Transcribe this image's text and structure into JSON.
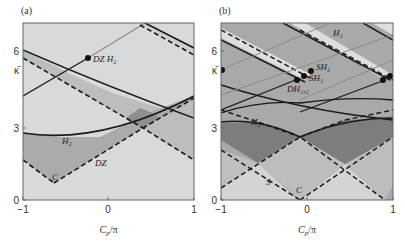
{
  "figure": {
    "panels": [
      {
        "id": "a",
        "title": "(a)",
        "frame": {
          "x0": 23,
          "x1": 194,
          "y0": 23,
          "y1": 200
        },
        "yticks": [
          {
            "label": "6",
            "y": 51
          },
          {
            "label": "κ̄",
            "y": 70
          },
          {
            "label": "3",
            "y": 128
          },
          {
            "label": "0",
            "y": 200
          }
        ],
        "xticks": [
          {
            "label": "−1",
            "x": 23
          },
          {
            "label": "0",
            "x": 108
          },
          {
            "label": "1",
            "x": 194
          }
        ],
        "xlabel": "C_p/π",
        "regions": [
          {
            "name": "background",
            "fill": "#d9d9d9",
            "points": "23,23 194,23 194,200 23,200"
          },
          {
            "name": "band-upper",
            "fill": "#bdbdbd",
            "points": "23,50 23,58 143,128 194,160 194,118 160,108 110,92 70,74"
          },
          {
            "name": "band-H2-lower",
            "fill": "#ababab",
            "points": "23,133 23,160 54,183 143,128 160,118 194,100 194,96 150,112 100,137 60,137"
          },
          {
            "name": "dark-diamond",
            "fill": "#8f8f8f",
            "points": "126,118 143,128 160,118 150,112 140,108"
          },
          {
            "name": "right-lower-band",
            "fill": "#bdbdbd",
            "points": "160,118 194,100 194,160 143,128"
          },
          {
            "name": "top-right-band",
            "fill": "#cfcfcf",
            "points": "145,23 194,48 194,55 140,23"
          }
        ],
        "lines": [
          {
            "name": "upper-solid-curve",
            "style": "solid",
            "color": "#1a1a1a",
            "width": 1.6,
            "path": "M23,50 Q110,88 194,118"
          },
          {
            "name": "upper-dashed",
            "style": "dashed",
            "color": "#1a1a1a",
            "width": 1.6,
            "path": "M23,58 L143,128 L194,160"
          },
          {
            "name": "H2-curve",
            "style": "solid",
            "color": "#1a1a1a",
            "width": 1.6,
            "path": "M23,133 Q100,145 194,96"
          },
          {
            "name": "DZ-dashed-left",
            "style": "dashed",
            "color": "#1a1a1a",
            "width": 1.6,
            "path": "M23,160 L54,183"
          },
          {
            "name": "DZ-dashed-right",
            "style": "dashed",
            "color": "#1a1a1a",
            "width": 1.6,
            "path": "M54,183 L143,128 L194,98"
          },
          {
            "name": "branch-black",
            "style": "solid",
            "color": "#1a1a1a",
            "width": 1.4,
            "path": "M23,96 L88,58"
          },
          {
            "name": "branch-gray",
            "style": "solid",
            "color": "#8a8a8a",
            "width": 1.2,
            "path": "M88,58 L145,23"
          },
          {
            "name": "top-right-solid",
            "style": "solid",
            "color": "#1a1a1a",
            "width": 1.6,
            "path": "M145,23 L194,48"
          },
          {
            "name": "top-right-dashed",
            "style": "dashed",
            "color": "#1a1a1a",
            "width": 1.6,
            "path": "M140,25 L194,55"
          }
        ],
        "points": [
          {
            "name": "DZ-H2-point",
            "x": 88,
            "y": 58,
            "r": 3
          }
        ],
        "annotations": [
          {
            "name": "label-DZ-H2",
            "text": "DZ H₂",
            "x": 93,
            "y": 62
          },
          {
            "name": "label-H2",
            "text": "H₂",
            "x": 62,
            "y": 144
          },
          {
            "name": "label-DZ",
            "text": "DZ",
            "x": 95,
            "y": 166
          },
          {
            "name": "label-C",
            "text": "C",
            "x": 52,
            "y": 180
          }
        ]
      },
      {
        "id": "b",
        "title": "(b)",
        "frame": {
          "x0": 221,
          "x1": 393,
          "y0": 23,
          "y1": 200
        },
        "yticks": [
          {
            "label": "6",
            "y": 51
          },
          {
            "label": "κ̄",
            "y": 70
          },
          {
            "label": "3",
            "y": 128
          },
          {
            "label": "0",
            "y": 200
          }
        ],
        "xticks": [
          {
            "label": "−1",
            "x": 221
          },
          {
            "label": "0",
            "x": 307
          },
          {
            "label": "1",
            "x": 393
          }
        ],
        "xlabel": "C_p/π",
        "regions": [
          {
            "name": "background",
            "fill": "#a9a9a9",
            "points": "221,23 393,23 393,200 221,200"
          },
          {
            "name": "bottom-light-left",
            "fill": "#d4d4d4",
            "points": "221,200 221,188 258,163 298,200"
          },
          {
            "name": "bottom-light-right",
            "fill": "#d4d4d4",
            "points": "300,200 345,164 385,200"
          },
          {
            "name": "mid-diamond-left",
            "fill": "#bfbfbf",
            "points": "221,150 258,163 221,188"
          },
          {
            "name": "mid-diamond-center",
            "fill": "#bdbdbd",
            "points": "258,163 300,137 345,164 300,200"
          },
          {
            "name": "mid-diamond-right",
            "fill": "#bdbdbd",
            "points": "345,164 393,137 393,185 385,200"
          },
          {
            "name": "dark-band-left",
            "fill": "#7d7d7d",
            "points": "221,123 260,122 300,137 258,163 221,140"
          },
          {
            "name": "dark-band-right",
            "fill": "#7d7d7d",
            "points": "300,137 345,120 393,118 393,137 345,164"
          },
          {
            "name": "light-stripe-top-left",
            "fill": "#dedede",
            "points": "221,28 221,38 305,80 310,74"
          },
          {
            "name": "light-stripe-top-mid",
            "fill": "#dedede",
            "points": "290,23 305,23 393,75 385,80"
          },
          {
            "name": "light-stripe-top-right",
            "fill": "#dedede",
            "points": "372,23 393,23 393,35"
          }
        ],
        "lines": [
          {
            "name": "solid-1",
            "style": "solid",
            "color": "#1a1a1a",
            "width": 1.5,
            "path": "M221,40 L305,82"
          },
          {
            "name": "dashed-1",
            "style": "dashed",
            "color": "#1a1a1a",
            "width": 1.5,
            "path": "M221,30 L310,78"
          },
          {
            "name": "solid-2",
            "style": "solid",
            "color": "#1a1a1a",
            "width": 1.5,
            "path": "M283,23 L390,80"
          },
          {
            "name": "dashed-2",
            "style": "dashed",
            "color": "#1a1a1a",
            "width": 1.5,
            "path": "M300,30 L393,80"
          },
          {
            "name": "solid-3",
            "style": "solid",
            "color": "#1a1a1a",
            "width": 1.5,
            "path": "M363,23 L393,40"
          },
          {
            "name": "solid-4",
            "style": "solid",
            "color": "#1a1a1a",
            "width": 1.5,
            "path": "M221,85 Q300,110 393,120"
          },
          {
            "name": "H2-curve",
            "style": "solid",
            "color": "#1a1a1a",
            "width": 1.5,
            "path": "M221,122 Q260,118 300,137 Q345,118 393,118"
          },
          {
            "name": "H2-curve-upper",
            "style": "solid",
            "color": "#1a1a1a",
            "width": 1.3,
            "path": "M221,113 Q260,100 300,103 Q350,96 393,100"
          },
          {
            "name": "branch-left",
            "style": "solid",
            "color": "#1a1a1a",
            "width": 1.3,
            "path": "M221,110 L298,79"
          },
          {
            "name": "branch-right",
            "style": "solid",
            "color": "#1a1a1a",
            "width": 1.3,
            "path": "M300,112 L385,80"
          },
          {
            "name": "gray-thin-1",
            "style": "solid",
            "color": "#8a8a8a",
            "width": 1.0,
            "path": "M221,70 L330,23"
          },
          {
            "name": "gray-thin-2",
            "style": "solid",
            "color": "#8a8a8a",
            "width": 1.0,
            "path": "M221,95 L393,35"
          },
          {
            "name": "gray-thin-3",
            "style": "solid",
            "color": "#8a8a8a",
            "width": 1.0,
            "path": "M300,100 L393,60"
          },
          {
            "name": "dashed-X-1",
            "style": "dashed",
            "color": "#1a1a1a",
            "width": 1.5,
            "path": "M221,150 L300,200"
          },
          {
            "name": "dashed-X-2",
            "style": "dashed",
            "color": "#1a1a1a",
            "width": 1.5,
            "path": "M221,188 L300,137 L385,200"
          },
          {
            "name": "dashed-X-3",
            "style": "dashed",
            "color": "#1a1a1a",
            "width": 1.5,
            "path": "M300,200 L393,137"
          },
          {
            "name": "dashed-X-4",
            "style": "dashed",
            "color": "#1a1a1a",
            "width": 1.5,
            "path": "M221,110 L258,122 L300,137"
          },
          {
            "name": "dashed-X-5",
            "style": "dashed",
            "color": "#1a1a1a",
            "width": 1.5,
            "path": "M300,137 L345,120 L393,110"
          }
        ],
        "points": [
          {
            "name": "kappa-point",
            "x": 222,
            "y": 70,
            "r": 3
          },
          {
            "name": "DH12-point",
            "x": 297,
            "y": 80,
            "r": 3
          },
          {
            "name": "SH1-point",
            "x": 304,
            "y": 76,
            "r": 3
          },
          {
            "name": "SH2-point",
            "x": 311,
            "y": 71,
            "r": 3
          },
          {
            "name": "right-point-1",
            "x": 383,
            "y": 80,
            "r": 3
          },
          {
            "name": "right-point-2",
            "x": 390,
            "y": 76,
            "r": 3
          }
        ],
        "annotations": [
          {
            "name": "label-H1",
            "text": "H₁",
            "x": 333,
            "y": 36
          },
          {
            "name": "label-SH2",
            "text": "SH₂",
            "x": 316,
            "y": 70
          },
          {
            "name": "label-SH1",
            "text": "SH₁",
            "x": 309,
            "y": 81
          },
          {
            "name": "label-DH12",
            "text": "DH₁,₂",
            "x": 287,
            "y": 92
          },
          {
            "name": "label-H2",
            "text": "H₂",
            "x": 251,
            "y": 125
          },
          {
            "name": "label-S",
            "text": "S",
            "x": 266,
            "y": 185
          },
          {
            "name": "label-C",
            "text": "C",
            "x": 296,
            "y": 193
          }
        ]
      }
    ]
  },
  "chart_data": [
    {
      "type": "line",
      "title": "(a)",
      "xlabel": "C_p/π",
      "ylabel": "κ̄",
      "xlim": [
        -1,
        1
      ],
      "ylim": [
        0,
        6.9
      ],
      "xticks": [
        -1,
        0,
        1
      ],
      "yticks": [
        0,
        3,
        6
      ],
      "grid": false,
      "series": [
        {
          "name": "DZ (dashed)",
          "x": [
            -1,
            -0.64,
            0.4,
            1
          ],
          "values": [
            1.6,
            0.7,
            2.8,
            4.0
          ]
        },
        {
          "name": "H2",
          "x": [
            -1,
            -0.2,
            1
          ],
          "values": [
            2.6,
            2.4,
            4.0
          ]
        },
        {
          "name": "upper solid curve",
          "x": [
            -1,
            0,
            1
          ],
          "values": [
            5.9,
            4.6,
            3.2
          ]
        },
        {
          "name": "upper dashed",
          "x": [
            -1,
            0.4,
            1
          ],
          "values": [
            5.6,
            2.8,
            1.6
          ]
        },
        {
          "name": "branch to DZ H2",
          "x": [
            -1,
            -0.24,
            0.43
          ],
          "values": [
            4.0,
            5.5,
            6.9
          ]
        }
      ],
      "annotations": [
        "DZ H2",
        "H2",
        "DZ",
        "C"
      ],
      "special_points": [
        {
          "name": "DZ H2",
          "x": -0.24,
          "y": 5.5
        }
      ]
    },
    {
      "type": "line",
      "title": "(b)",
      "xlabel": "C_p/π",
      "ylabel": "κ̄",
      "xlim": [
        -1,
        1
      ],
      "ylim": [
        0,
        6.9
      ],
      "xticks": [
        -1,
        0,
        1
      ],
      "yticks": [
        0,
        3,
        6
      ],
      "grid": false,
      "series": [
        {
          "name": "H1 (parallel solid/dashed)",
          "x": [
            -1,
            0
          ],
          "values": [
            6.2,
            4.6
          ]
        },
        {
          "name": "H2",
          "x": [
            -1,
            -0.05,
            1
          ],
          "values": [
            3.0,
            2.5,
            3.2
          ]
        },
        {
          "name": "S (dashed)",
          "x": [
            -1,
            -0.57,
            -0.05
          ],
          "values": [
            0.5,
            1.45,
            0.0
          ]
        },
        {
          "name": "C (dashed)",
          "x": [
            -0.05,
            0.44,
            1
          ],
          "values": [
            0.0,
            1.4,
            2.5
          ]
        }
      ],
      "annotations": [
        "H1",
        "SH2",
        "SH1",
        "DH1,2",
        "H2",
        "S",
        "C"
      ],
      "special_points": [
        {
          "name": "κ̄",
          "x": -1,
          "y": 5.1
        },
        {
          "name": "DH1,2",
          "x": -0.12,
          "y": 4.7
        },
        {
          "name": "SH1",
          "x": -0.04,
          "y": 4.85
        },
        {
          "name": "SH2",
          "x": 0.04,
          "y": 5.05
        }
      ]
    }
  ]
}
